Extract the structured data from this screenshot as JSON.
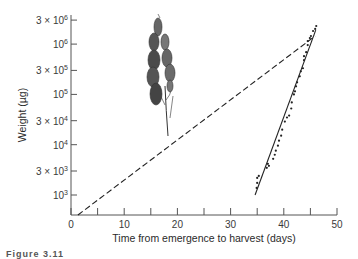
{
  "chart_data": {
    "type": "scatter",
    "title": "",
    "xlabel": "Time from emergence to harvest (days)",
    "ylabel": "Weight (µg)",
    "xlim": [
      0,
      50
    ],
    "ylim": [
      400,
      4000000
    ],
    "yscale": "log",
    "grid": false,
    "legend": null,
    "x_ticks": [
      0,
      5,
      10,
      15,
      20,
      25,
      30,
      35,
      40,
      45,
      50
    ],
    "x_tick_labels": [
      "0",
      "10",
      "20",
      "30",
      "40",
      "50"
    ],
    "y_ticks": [
      1000,
      3000,
      10000,
      30000,
      100000,
      300000,
      1000000,
      3000000
    ],
    "y_tick_labels": [
      {
        "coef": "",
        "exp": "3"
      },
      {
        "coef": "3 × ",
        "exp": "3"
      },
      {
        "coef": "",
        "exp": "4"
      },
      {
        "coef": "3 × ",
        "exp": "4"
      },
      {
        "coef": "",
        "exp": "5"
      },
      {
        "coef": "3 × ",
        "exp": "5"
      },
      {
        "coef": "",
        "exp": "6"
      },
      {
        "coef": "3 × ",
        "exp": "6"
      }
    ],
    "series": [
      {
        "name": "Observed grain weights",
        "style": "points",
        "points": [
          [
            34.9,
            1380
          ],
          [
            35.0,
            1740
          ],
          [
            35.0,
            2190
          ],
          [
            35.3,
            2400
          ],
          [
            36.8,
            3470
          ],
          [
            37.2,
            3800
          ],
          [
            37.0,
            4170
          ],
          [
            38.0,
            5250
          ],
          [
            38.3,
            6310
          ],
          [
            38.5,
            7590
          ],
          [
            38.9,
            9550
          ],
          [
            39.1,
            12000
          ],
          [
            39.5,
            15100
          ],
          [
            39.7,
            19900
          ],
          [
            40.2,
            28800
          ],
          [
            40.6,
            34700
          ],
          [
            41.0,
            38000
          ],
          [
            41.4,
            52500
          ],
          [
            41.5,
            69200
          ],
          [
            41.9,
            100000
          ],
          [
            42.1,
            115000
          ],
          [
            42.3,
            145000
          ],
          [
            42.5,
            174000
          ],
          [
            43.0,
            229000
          ],
          [
            43.2,
            288000
          ],
          [
            43.6,
            331000
          ],
          [
            43.8,
            479000
          ],
          [
            43.8,
            575000
          ],
          [
            44.2,
            692000
          ],
          [
            44.5,
            955000
          ],
          [
            44.5,
            1150000
          ],
          [
            44.9,
            1320000
          ],
          [
            45.1,
            1450000
          ],
          [
            45.5,
            1820000
          ],
          [
            45.9,
            2000000
          ],
          [
            46.1,
            2290000
          ]
        ]
      },
      {
        "name": "Fitted exponential growth (grain)",
        "style": "solid",
        "points": [
          [
            34.6,
            1000
          ],
          [
            46.0,
            1900000
          ]
        ]
      },
      {
        "name": "Exponential growth from emergence",
        "style": "dashed",
        "points": [
          [
            1.3,
            400
          ],
          [
            45.9,
            1450000
          ]
        ]
      }
    ],
    "annotations": [
      "Illustration of grass seed head (panicle)"
    ]
  },
  "caption": "Figure 3.11"
}
